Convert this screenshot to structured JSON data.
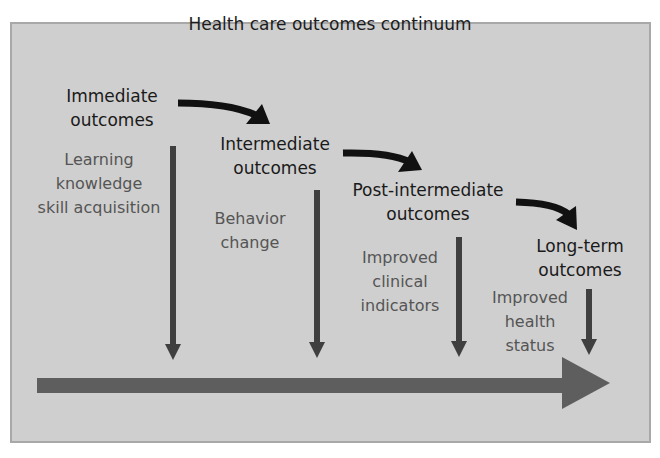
{
  "diagram": {
    "title": "Health care outcomes continuum",
    "colors": {
      "background": "#cfcfcf",
      "border": "#a8a8a8",
      "stage_text": "#1a1a1a",
      "desc_text": "#555555",
      "curved_arrow": "#111111",
      "down_arrow": "#3f3f3f",
      "timeline_arrow": "#5e5e5e"
    },
    "stages": [
      {
        "label": "Immediate\noutcomes",
        "description": "Learning\nknowledge\nskill acquisition"
      },
      {
        "label": "Intermediate\noutcomes",
        "description": "Behavior\nchange"
      },
      {
        "label": "Post-intermediate\noutcomes",
        "description": "Improved\nclinical\nindicators"
      },
      {
        "label": "Long-term\noutcomes",
        "description": "Improved\nhealth\nstatus"
      }
    ]
  }
}
